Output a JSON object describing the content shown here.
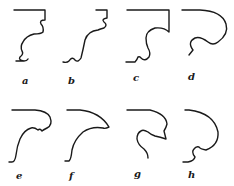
{
  "figure": {
    "profiles": [
      {
        "label": "a"
      },
      {
        "label": "b"
      },
      {
        "label": "c"
      },
      {
        "label": "d"
      },
      {
        "label": "e"
      },
      {
        "label": "f"
      },
      {
        "label": "g"
      },
      {
        "label": "h"
      }
    ]
  }
}
